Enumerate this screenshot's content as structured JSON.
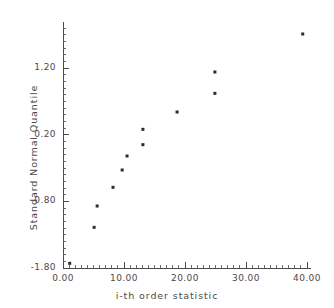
{
  "chart_data": {
    "type": "scatter",
    "title": "",
    "xlabel": "i-th order statistic",
    "ylabel": "Standard Normal Quantile",
    "xlim": [
      0.0,
      40.0
    ],
    "ylim": [
      -1.8,
      1.8
    ],
    "xticks": [
      0.0,
      10.0,
      20.0,
      30.0,
      40.0
    ],
    "xtick_labels": [
      "0.00",
      "10.00",
      "20.00",
      "30.00",
      "40.00"
    ],
    "yticks": [
      -1.8,
      -0.8,
      0.2,
      1.2
    ],
    "ytick_labels": [
      "-1.80",
      "-0.80",
      "0.20",
      "1.20"
    ],
    "grid": false,
    "legend": null,
    "minor_ticks": true,
    "x": [
      1.1,
      5.1,
      5.6,
      8.2,
      9.7,
      10.5,
      13.1,
      13.1,
      18.7,
      24.9,
      24.9,
      39.3
    ],
    "y": [
      -1.73,
      -1.19,
      -0.87,
      -0.59,
      -0.33,
      -0.12,
      0.05,
      0.28,
      0.54,
      0.82,
      1.14,
      1.71
    ],
    "marker": "square",
    "marker_color": "#2b2b2b",
    "marker_size": 3
  },
  "axes": {
    "x_axis_name": "i-th order statistic",
    "y_axis_name": "Standard Normal Quantile"
  },
  "caption": {
    "text": ""
  },
  "colors": {
    "axis": "#4a4a4a",
    "marker": "#2b2b2b",
    "background": "#ffffff"
  }
}
